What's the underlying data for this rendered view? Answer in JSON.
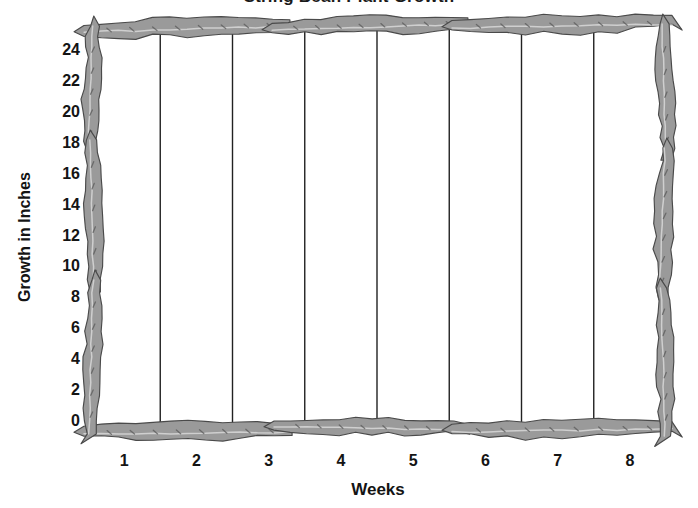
{
  "chart_data": {
    "type": "bar",
    "title": "String Bean Plant Growth",
    "subtitle": "",
    "xlabel": "Weeks",
    "ylabel": "Growth in Inches",
    "categories": [
      "1",
      "2",
      "3",
      "4",
      "5",
      "6",
      "7",
      "8"
    ],
    "values": [
      0,
      0,
      0,
      0,
      0,
      0,
      0,
      0
    ],
    "series": [
      {
        "name": "Growth in Inches",
        "values": [
          0,
          0,
          0,
          0,
          0,
          0,
          0,
          0
        ]
      }
    ],
    "x_tick_labels": [
      "1",
      "2",
      "3",
      "4",
      "5",
      "6",
      "7",
      "8"
    ],
    "y_tick_labels": [
      "0",
      "2",
      "4",
      "6",
      "8",
      "10",
      "12",
      "14",
      "16",
      "18",
      "20",
      "22",
      "24"
    ],
    "y_tick_values": [
      0,
      2,
      4,
      6,
      8,
      10,
      12,
      14,
      16,
      18,
      20,
      22,
      24
    ],
    "ylim": [
      0,
      25
    ],
    "xlim": [
      0,
      8
    ],
    "grid": "vertical-category-dividers",
    "legend": "none",
    "legend_position": "none",
    "annotations": [],
    "note": "Blank worksheet grid: axes and category dividers only, no plotted data bars drawn.",
    "colors": {
      "background": "#ffffff",
      "plot_background": "#ffffff",
      "gridline": "#222222",
      "border_fill": "#9a9a9a",
      "border_fill_light": "#b4b4b4",
      "border_outline": "#4a4a4a",
      "border_highlight": "#d8d8d8",
      "seed_mark": "#5a5a5a",
      "text": "#141414"
    }
  },
  "decor": {
    "border_motif": "bean-pod-vine",
    "description": "Hand-drawn gray string-bean pods forming the chart frame on all four sides"
  }
}
